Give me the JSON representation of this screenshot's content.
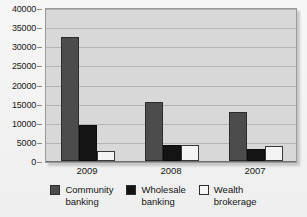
{
  "chart_data": {
    "type": "bar",
    "title": "",
    "subtitle": "",
    "xlabel": "",
    "ylabel": "",
    "categories": [
      "2009",
      "2008",
      "2007"
    ],
    "series": [
      {
        "name": "Community banking",
        "values": [
          32500,
          15400,
          12700
        ],
        "color": "#4c4c4c"
      },
      {
        "name": "Wholesale banking",
        "values": [
          9500,
          4100,
          3100
        ],
        "color": "#141414"
      },
      {
        "name": "Wealth brokerage",
        "values": [
          2700,
          4200,
          3900
        ],
        "color": "#f4f4f4"
      }
    ],
    "ylim": [
      0,
      40000
    ],
    "ytick_step": 5000,
    "yticks": [
      "0",
      "5000",
      "10000",
      "15000",
      "20000",
      "25000",
      "30000",
      "35000",
      "40000"
    ],
    "grid": true,
    "grid_axis": "y",
    "legend_position": "bottom",
    "legend_entries": [
      {
        "label_line1": "Community",
        "label_line2": "banking"
      },
      {
        "label_line1": "Wholesale",
        "label_line2": "banking"
      },
      {
        "label_line1": "Wealth",
        "label_line2": "brokerage"
      }
    ],
    "plot_background": "#d8d8d8",
    "figure_background": "#f1f1f1"
  }
}
